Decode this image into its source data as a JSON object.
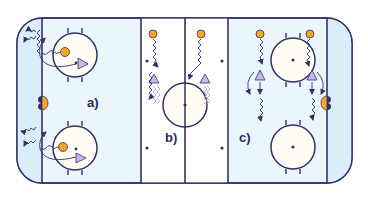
{
  "diagram": {
    "type": "hockey-rink-drill",
    "colors": {
      "rink_ice": "#ffffff",
      "end_zone_tint": "#dff1fa",
      "lines": "#35306a",
      "player_orange": "#f5a623",
      "player_triangle": "#b7a6d8",
      "goal_orange": "#f5a623",
      "goal_dark": "#35306a",
      "circle_fill": "#fffdf3"
    },
    "panels": [
      {
        "id": "a",
        "label": "a)"
      },
      {
        "id": "b",
        "label": "b)"
      },
      {
        "id": "c",
        "label": "c)"
      }
    ]
  }
}
